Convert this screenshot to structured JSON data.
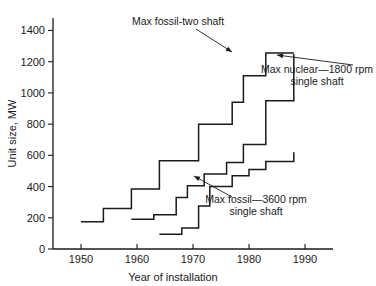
{
  "chart_data": {
    "type": "line",
    "title": "",
    "xlabel": "Year of installation",
    "ylabel": "Unit size, MW",
    "xlim": [
      1945,
      1997
    ],
    "ylim": [
      0,
      1480
    ],
    "xticks": [
      1950,
      1960,
      1970,
      1980,
      1990
    ],
    "yticks": [
      0,
      200,
      400,
      600,
      800,
      1000,
      1200,
      1400
    ],
    "grid": false,
    "legend_position": "annotations-inline",
    "drawstyle": "steps-post",
    "series": [
      {
        "name": "Max fossil-two shaft",
        "x": [
          1950,
          1954,
          1959,
          1964,
          1968,
          1971,
          1974,
          1977,
          1979,
          1983,
          1988
        ],
        "y": [
          175,
          260,
          385,
          565,
          565,
          800,
          800,
          940,
          1110,
          1255,
          1255
        ]
      },
      {
        "name": "Max nuclear—1800 rpm single shaft",
        "x": [
          1959,
          1963,
          1967,
          1969,
          1972,
          1976,
          1979,
          1983,
          1988
        ],
        "y": [
          190,
          220,
          330,
          405,
          480,
          555,
          670,
          950,
          1250
        ]
      },
      {
        "name": "Max fossil—3600 rpm single shaft",
        "x": [
          1964,
          1968,
          1971,
          1973,
          1977,
          1980,
          1983,
          1988
        ],
        "y": [
          95,
          135,
          275,
          400,
          470,
          510,
          560,
          620
        ]
      }
    ],
    "annotations": [
      {
        "id": "annot-fossil-two-shaft",
        "lines": [
          "Max fossil-two shaft"
        ],
        "align": "left",
        "text_x": 132,
        "text_y": 25,
        "leader": [
          [
            196,
            29
          ],
          [
            232,
            52
          ]
        ]
      },
      {
        "id": "annot-max-nuclear",
        "lines": [
          "Max nuclear—1800 rpm",
          "single shaft"
        ],
        "align": "center",
        "text_x": 317,
        "text_y": 73,
        "leader": [
          [
            353,
            65
          ],
          [
            277,
            55
          ]
        ]
      },
      {
        "id": "annot-max-fossil-3600",
        "lines": [
          "Max fossil—3600 rpm",
          "single shaft"
        ],
        "align": "center",
        "text_x": 256,
        "text_y": 203,
        "leader": [
          [
            232,
            197
          ],
          [
            194,
            176
          ]
        ]
      }
    ]
  },
  "geometry": {
    "x_axis_pixel_start": 53,
    "x_axis_pixel_end": 333,
    "y_axis_pixel_top": 18,
    "y_axis_pixel_bottom": 249,
    "x_value_min": 1945,
    "x_value_max": 1995,
    "y_value_min": 0,
    "y_value_max": 1480
  }
}
